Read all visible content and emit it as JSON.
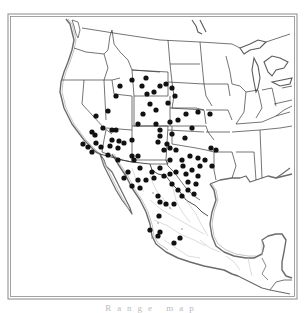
{
  "map": {
    "type": "distribution-map",
    "region": "western/central United States and Mexico",
    "colors": {
      "background": "#ffffff",
      "frame": "#8a8a8a",
      "coastline": "#6b6b6b",
      "coast_inner": "#b5b5b5",
      "state_border": "#3a3a3a",
      "mexico_border": "#b0b0b0",
      "dot": "#111111"
    },
    "dot_radius": 2.6,
    "dots": [
      [
        120,
        86
      ],
      [
        132,
        80
      ],
      [
        142,
        86
      ],
      [
        116,
        96
      ],
      [
        146,
        78
      ],
      [
        147,
        94
      ],
      [
        154,
        92
      ],
      [
        160,
        86
      ],
      [
        166,
        84
      ],
      [
        172,
        88
      ],
      [
        175,
        96
      ],
      [
        168,
        103
      ],
      [
        150,
        104
      ],
      [
        156,
        110
      ],
      [
        143,
        114
      ],
      [
        138,
        124
      ],
      [
        96,
        116
      ],
      [
        108,
        111
      ],
      [
        103,
        128
      ],
      [
        112,
        130
      ],
      [
        116,
        130
      ],
      [
        92,
        132
      ],
      [
        95,
        135
      ],
      [
        96,
        143
      ],
      [
        101,
        147
      ],
      [
        112,
        140
      ],
      [
        119,
        141
      ],
      [
        110,
        146
      ],
      [
        118,
        148
      ],
      [
        124,
        143
      ],
      [
        132,
        140
      ],
      [
        108,
        155
      ],
      [
        118,
        160
      ],
      [
        132,
        156
      ],
      [
        138,
        156
      ],
      [
        83,
        144
      ],
      [
        88,
        147
      ],
      [
        92,
        152
      ],
      [
        156,
        124
      ],
      [
        160,
        130
      ],
      [
        170,
        122
      ],
      [
        178,
        120
      ],
      [
        186,
        114
      ],
      [
        198,
        112
      ],
      [
        210,
        114
      ],
      [
        192,
        128
      ],
      [
        185,
        138
      ],
      [
        172,
        134
      ],
      [
        167,
        144
      ],
      [
        170,
        148
      ],
      [
        176,
        150
      ],
      [
        182,
        160
      ],
      [
        190,
        156
      ],
      [
        198,
        158
      ],
      [
        205,
        160
      ],
      [
        211,
        148
      ],
      [
        216,
        150
      ],
      [
        160,
        136
      ],
      [
        158,
        142
      ],
      [
        164,
        150
      ],
      [
        170,
        160
      ],
      [
        160,
        168
      ],
      [
        152,
        172
      ],
      [
        146,
        180
      ],
      [
        154,
        178
      ],
      [
        164,
        176
      ],
      [
        170,
        174
      ],
      [
        176,
        172
      ],
      [
        186,
        174
      ],
      [
        192,
        170
      ],
      [
        198,
        176
      ],
      [
        200,
        166
      ],
      [
        212,
        166
      ],
      [
        134,
        160
      ],
      [
        140,
        168
      ],
      [
        138,
        180
      ],
      [
        128,
        172
      ],
      [
        124,
        178
      ],
      [
        132,
        186
      ],
      [
        140,
        188
      ],
      [
        172,
        184
      ],
      [
        178,
        190
      ],
      [
        182,
        196
      ],
      [
        188,
        182
      ],
      [
        196,
        184
      ],
      [
        194,
        194
      ],
      [
        183,
        166
      ],
      [
        188,
        190
      ],
      [
        158,
        196
      ],
      [
        160,
        202
      ],
      [
        166,
        204
      ],
      [
        174,
        204
      ],
      [
        159,
        216
      ],
      [
        150,
        230
      ],
      [
        158,
        236
      ],
      [
        174,
        243
      ],
      [
        180,
        238
      ],
      [
        160,
        232
      ]
    ],
    "small_dots": [
      [
        153,
        193
      ],
      [
        158,
        223
      ],
      [
        170,
        208
      ],
      [
        152,
        238
      ],
      [
        182,
        229
      ]
    ]
  },
  "caption": {
    "text": "Range map"
  }
}
